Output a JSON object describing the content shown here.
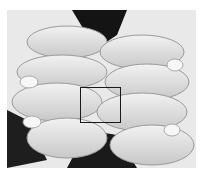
{
  "image": {
    "description": "Grayscale photograph of two clasped hands with fingers interlocking, knuckles facing viewer",
    "region_of_interest": {
      "x": 80,
      "y": 87,
      "width": 41,
      "height": 36
    },
    "colors": {
      "background": "#ffffff",
      "skin_light": "#e6e6e6",
      "skin_mid": "#bdbdbd",
      "shadow": "#1a1a1a",
      "box": "#1a1a1a"
    }
  }
}
